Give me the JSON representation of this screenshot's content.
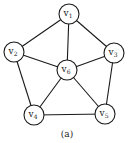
{
  "diagram": {
    "type": "graph",
    "caption": "(a)",
    "colors": {
      "stroke": "#1a1a1a",
      "fill": "#ffffff"
    },
    "node_radius": 10,
    "nodes": [
      {
        "id": "v1",
        "base": "v",
        "sub": "1",
        "x": 69,
        "y": 14
      },
      {
        "id": "v2",
        "base": "v",
        "sub": "2",
        "x": 14,
        "y": 52
      },
      {
        "id": "v3",
        "base": "v",
        "sub": "3",
        "x": 114,
        "y": 53
      },
      {
        "id": "v4",
        "base": "v",
        "sub": "4",
        "x": 34,
        "y": 115
      },
      {
        "id": "v5",
        "base": "v",
        "sub": "5",
        "x": 105,
        "y": 114
      },
      {
        "id": "v6",
        "base": "v",
        "sub": "6",
        "x": 67,
        "y": 70
      }
    ],
    "edges": [
      [
        "v1",
        "v2"
      ],
      [
        "v1",
        "v3"
      ],
      [
        "v1",
        "v6"
      ],
      [
        "v2",
        "v6"
      ],
      [
        "v3",
        "v6"
      ],
      [
        "v2",
        "v4"
      ],
      [
        "v3",
        "v5"
      ],
      [
        "v4",
        "v5"
      ],
      [
        "v4",
        "v6"
      ],
      [
        "v5",
        "v6"
      ]
    ]
  }
}
